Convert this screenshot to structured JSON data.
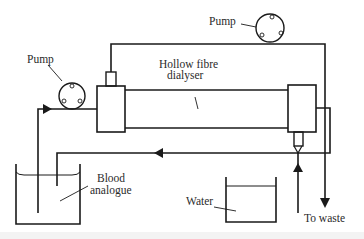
{
  "diagram": {
    "labels": {
      "pump_top": "Pump",
      "pump_left": "Pump",
      "dialyser_line1": "Hollow fibre",
      "dialyser_line2": "dialyser",
      "blood_line1": "Blood",
      "blood_line2": "analogue",
      "water": "Water",
      "waste": "To waste"
    },
    "components": [
      {
        "id": "pump-top",
        "type": "peristaltic-pump"
      },
      {
        "id": "pump-left",
        "type": "peristaltic-pump"
      },
      {
        "id": "dialyser",
        "type": "hollow-fibre-dialyser"
      },
      {
        "id": "blood-reservoir",
        "type": "beaker",
        "contents": "Blood analogue"
      },
      {
        "id": "water-reservoir",
        "type": "beaker",
        "contents": "Water"
      },
      {
        "id": "waste-outlet",
        "type": "outlet"
      }
    ],
    "colors": {
      "line": "#1a1a1a",
      "text": "#2a2a2a",
      "background": "#ffffff"
    }
  }
}
